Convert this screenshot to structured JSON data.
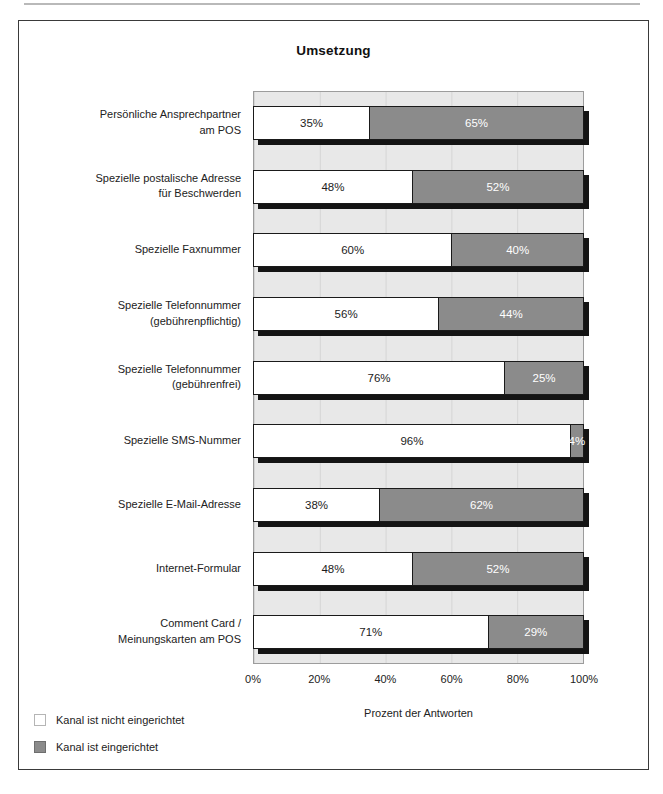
{
  "chart_data": {
    "type": "bar",
    "orientation": "horizontal",
    "stacked": true,
    "title": "Umsetzung",
    "categories": [
      "Persönliche Ansprechpartner\nam POS",
      "Spezielle postalische Adresse\nfür Beschwerden",
      "Spezielle Faxnummer",
      "Spezielle Telefonnummer\n(gebührenpflichtig)",
      "Spezielle Telefonnummer\n(gebührenfrei)",
      "Spezielle SMS-Nummer",
      "Spezielle E-Mail-Adresse",
      "Internet-Formular",
      "Comment Card /\nMeinungskarten am POS"
    ],
    "series": [
      {
        "name": "Kanal ist nicht eingerichtet",
        "color": "#ffffff",
        "values": [
          35,
          48,
          60,
          56,
          76,
          96,
          38,
          48,
          71
        ]
      },
      {
        "name": "Kanal ist eingerichtet",
        "color": "#8b8b8b",
        "values": [
          65,
          52,
          40,
          44,
          25,
          4,
          62,
          52,
          29
        ]
      }
    ],
    "value_labels": [
      [
        "35%",
        "65%"
      ],
      [
        "48%",
        "52%"
      ],
      [
        "60%",
        "40%"
      ],
      [
        "56%",
        "44%"
      ],
      [
        "76%",
        "25%"
      ],
      [
        "96%",
        "4%"
      ],
      [
        "38%",
        "62%"
      ],
      [
        "48%",
        "52%"
      ],
      [
        "71%",
        "29%"
      ]
    ],
    "xlabel": "Prozent der Antworten",
    "x_ticks": [
      "0%",
      "20%",
      "40%",
      "60%",
      "80%",
      "100%"
    ],
    "xlim": [
      0,
      100
    ],
    "grid": "vertical gridlines every 20%",
    "legend_position": "bottom-left",
    "colors": {
      "plot_background": "#e8e8e8",
      "gridline": "#d5d5d5",
      "bar_filled": "#8b8b8b",
      "bar_empty": "#ffffff",
      "bar_shadow": "#141414",
      "frame_border": "#3a3a3a"
    }
  }
}
